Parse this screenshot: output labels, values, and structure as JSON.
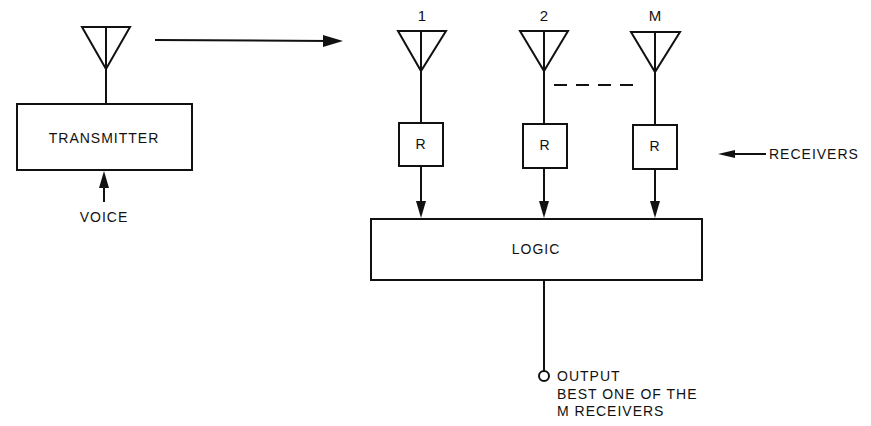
{
  "diagram": {
    "transmitter": {
      "label": "TRANSMITTER",
      "input_label": "VOICE"
    },
    "antennas": [
      {
        "label": "1"
      },
      {
        "label": "2"
      },
      {
        "label": "M"
      }
    ],
    "receivers": [
      {
        "label": "R"
      },
      {
        "label": "R"
      },
      {
        "label": "R"
      }
    ],
    "receivers_annotation": "RECEIVERS",
    "logic": {
      "label": "LOGIC"
    },
    "output": {
      "lines": [
        "OUTPUT",
        "BEST ONE OF THE",
        "M RECEIVERS"
      ]
    }
  }
}
